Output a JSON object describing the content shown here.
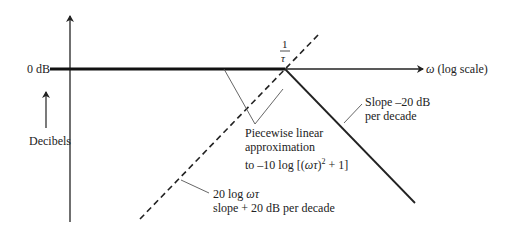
{
  "diagram": {
    "type": "bode-magnitude-asymptotic",
    "labels": {
      "zero_db": "0 dB",
      "decibels": "Decibels",
      "corner_num": "1",
      "corner_den": "τ",
      "x_axis_symbol": "ω",
      "x_axis_text": "(log scale)",
      "slope_neg_line1": "Slope –20 dB",
      "slope_neg_line2": "per decade",
      "piecewise_line1": "Piecewise linear",
      "piecewise_line2": "approximation",
      "piecewise_line3_pre": "to –10 log [(",
      "piecewise_line3_var": "ωτ",
      "piecewise_line3_post": ")",
      "piecewise_line3_sup": "2",
      "piecewise_line3_end": " + 1]",
      "dashed_line1_pre": "20 log ",
      "dashed_line1_var": "ωτ",
      "dashed_line2": "slope + 20 dB per decade"
    }
  }
}
